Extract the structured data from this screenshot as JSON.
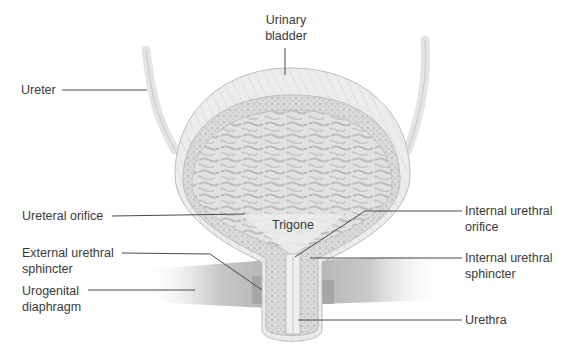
{
  "diagram": {
    "colors": {
      "background": "#ffffff",
      "label_text": "#3a3a3a",
      "leader_line": "#4a4a4a",
      "tissue_light": "#e6e6e6",
      "tissue_mid": "#cfcfcf",
      "tissue_dark": "#9a9a9a"
    },
    "labels": {
      "urinary_bladder": {
        "line1": "Urinary",
        "line2": "bladder"
      },
      "ureter": {
        "line1": "Ureter"
      },
      "ureteral_orifice": {
        "line1": "Ureteral orifice"
      },
      "trigone": {
        "line1": "Trigone"
      },
      "external_urethral_sphincter": {
        "line1": "External urethral",
        "line2": "sphincter"
      },
      "urogenital_diaphragm": {
        "line1": "Urogenital",
        "line2": "diaphragm"
      },
      "internal_urethral_orifice": {
        "line1": "Internal urethral",
        "line2": "orifice"
      },
      "internal_urethral_sphincter": {
        "line1": "Internal urethral",
        "line2": "sphincter"
      },
      "urethra": {
        "line1": "Urethra"
      }
    }
  }
}
